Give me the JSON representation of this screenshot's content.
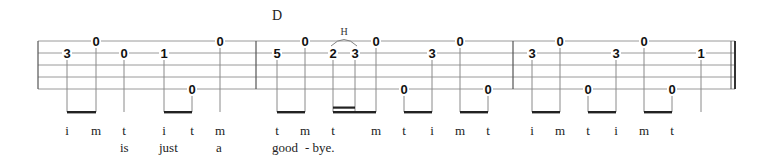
{
  "staff": {
    "lines_y": [
      41,
      53,
      65,
      77,
      89
    ],
    "x_start": 38,
    "x_end": 735,
    "line_color": "#9a9a9a",
    "barline_color": "#555555",
    "barlines": [
      38,
      256,
      513
    ],
    "final_barline": [
      731,
      735
    ]
  },
  "chords": [
    {
      "label": "D",
      "x": 272,
      "y": 20
    }
  ],
  "hammer_on": {
    "label": "H",
    "x": 344,
    "y": 35,
    "from_x": 333,
    "to_x": 355
  },
  "measures": [
    {
      "notes": [
        {
          "fret": "0",
          "x": 96,
          "string": 1
        },
        {
          "fret": "3",
          "x": 67,
          "string": 2
        },
        {
          "fret": "0",
          "x": 124,
          "string": 2
        },
        {
          "fret": "1",
          "x": 164,
          "string": 2
        },
        {
          "fret": "0",
          "x": 192,
          "string": 5
        },
        {
          "fret": "0",
          "x": 220,
          "string": 1
        }
      ]
    },
    {
      "notes": [
        {
          "fret": "5",
          "x": 277,
          "string": 2
        },
        {
          "fret": "0",
          "x": 305,
          "string": 1
        },
        {
          "fret": "2",
          "x": 333,
          "string": 2
        },
        {
          "fret": "3",
          "x": 355,
          "string": 2
        },
        {
          "fret": "0",
          "x": 376,
          "string": 1
        },
        {
          "fret": "0",
          "x": 404,
          "string": 5
        },
        {
          "fret": "3",
          "x": 432,
          "string": 2
        },
        {
          "fret": "0",
          "x": 460,
          "string": 1
        },
        {
          "fret": "0",
          "x": 488,
          "string": 5
        }
      ]
    },
    {
      "notes": [
        {
          "fret": "3",
          "x": 532,
          "string": 2
        },
        {
          "fret": "0",
          "x": 560,
          "string": 1
        },
        {
          "fret": "0",
          "x": 588,
          "string": 5
        },
        {
          "fret": "3",
          "x": 616,
          "string": 2
        },
        {
          "fret": "0",
          "x": 644,
          "string": 1
        },
        {
          "fret": "0",
          "x": 672,
          "string": 5
        },
        {
          "fret": "1",
          "x": 701,
          "string": 2
        }
      ]
    }
  ],
  "stems_x": [
    67,
    96,
    124,
    164,
    192,
    220,
    277,
    305,
    333,
    355,
    376,
    404,
    432,
    460,
    488,
    532,
    560,
    588,
    616,
    644,
    672,
    701
  ],
  "beams": [
    {
      "x1": 67,
      "x2": 96
    },
    {
      "x1": 164,
      "x2": 192
    },
    {
      "x1": 277,
      "x2": 305
    },
    {
      "x1": 333,
      "x2": 376
    },
    {
      "x1": 404,
      "x2": 432
    },
    {
      "x1": 460,
      "x2": 488
    },
    {
      "x1": 532,
      "x2": 560
    },
    {
      "x1": 588,
      "x2": 616
    },
    {
      "x1": 644,
      "x2": 672
    }
  ],
  "secondary_beams": [
    {
      "x1": 333,
      "x2": 355
    }
  ],
  "fingerings": [
    {
      "label": "i",
      "x": 67
    },
    {
      "label": "m",
      "x": 96
    },
    {
      "label": "t",
      "x": 124
    },
    {
      "label": "i",
      "x": 164
    },
    {
      "label": "t",
      "x": 192
    },
    {
      "label": "m",
      "x": 220
    },
    {
      "label": "t",
      "x": 277
    },
    {
      "label": "m",
      "x": 305
    },
    {
      "label": "t",
      "x": 333
    },
    {
      "label": "m",
      "x": 376
    },
    {
      "label": "t",
      "x": 404
    },
    {
      "label": "i",
      "x": 432
    },
    {
      "label": "m",
      "x": 460
    },
    {
      "label": "t",
      "x": 488
    },
    {
      "label": "i",
      "x": 532
    },
    {
      "label": "m",
      "x": 560
    },
    {
      "label": "t",
      "x": 588
    },
    {
      "label": "i",
      "x": 616
    },
    {
      "label": "m",
      "x": 644
    },
    {
      "label": "t",
      "x": 672
    }
  ],
  "lyrics": [
    {
      "text": "is",
      "x": 120
    },
    {
      "text": "just",
      "x": 159
    },
    {
      "text": "a",
      "x": 216
    },
    {
      "text": "good",
      "x": 272
    },
    {
      "text": "- bye.",
      "x": 305
    }
  ]
}
